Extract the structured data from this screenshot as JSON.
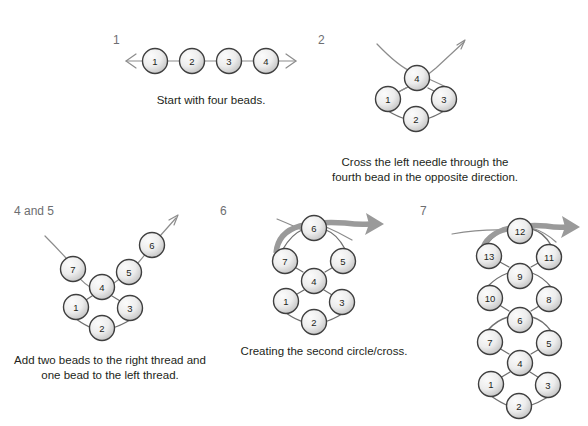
{
  "figure": {
    "background_color": "#ffffff",
    "bead_fill_light": "#f2f2f2",
    "bead_fill_dark": "#c9c9c9",
    "bead_stroke": "#3f3f3f",
    "thread_color": "#8c8c8c",
    "arrow_color": "#9a9a9a",
    "label_color": "#6d6e71",
    "text_color": "#231f20"
  },
  "panels": [
    {
      "id": "panel-1",
      "step_label": "1",
      "caption": "Start with four beads.",
      "beads": [
        {
          "number": "1",
          "x": 155,
          "y": 61
        },
        {
          "number": "2",
          "x": 192,
          "y": 61
        },
        {
          "number": "3",
          "x": 229,
          "y": 61
        },
        {
          "number": "4",
          "x": 266,
          "y": 61
        }
      ]
    },
    {
      "id": "panel-2",
      "step_label": "2",
      "caption_line_1": "Cross the left needle through the",
      "caption_line_2": "fourth bead in the opposite direction.",
      "beads": [
        {
          "number": "4",
          "x": 417,
          "y": 78
        },
        {
          "number": "1",
          "x": 388,
          "y": 99
        },
        {
          "number": "3",
          "x": 444,
          "y": 99
        },
        {
          "number": "2",
          "x": 416,
          "y": 119
        }
      ]
    },
    {
      "id": "panel-4and5",
      "step_label": "4 and 5",
      "caption_line_1": "Add two beads to the right thread and",
      "caption_line_2": "one bead to the left thread.",
      "beads": [
        {
          "number": "6",
          "x": 152,
          "y": 245
        },
        {
          "number": "5",
          "x": 129,
          "y": 272
        },
        {
          "number": "7",
          "x": 73,
          "y": 269
        },
        {
          "number": "4",
          "x": 102,
          "y": 287
        },
        {
          "number": "1",
          "x": 76,
          "y": 307
        },
        {
          "number": "3",
          "x": 130,
          "y": 308
        },
        {
          "number": "2",
          "x": 102,
          "y": 328
        }
      ]
    },
    {
      "id": "panel-6",
      "step_label": "6",
      "caption": "Creating the second circle/cross.",
      "beads": [
        {
          "number": "6",
          "x": 314,
          "y": 228
        },
        {
          "number": "7",
          "x": 285,
          "y": 261
        },
        {
          "number": "5",
          "x": 343,
          "y": 261
        },
        {
          "number": "4",
          "x": 314,
          "y": 281
        },
        {
          "number": "1",
          "x": 286,
          "y": 301
        },
        {
          "number": "3",
          "x": 342,
          "y": 302
        },
        {
          "number": "2",
          "x": 314,
          "y": 322
        }
      ]
    },
    {
      "id": "panel-7",
      "step_label": "7",
      "caption": "",
      "beads": [
        {
          "number": "12",
          "x": 520,
          "y": 231
        },
        {
          "number": "13",
          "x": 489,
          "y": 256
        },
        {
          "number": "11",
          "x": 549,
          "y": 257
        },
        {
          "number": "9",
          "x": 520,
          "y": 276
        },
        {
          "number": "10",
          "x": 490,
          "y": 298
        },
        {
          "number": "8",
          "x": 549,
          "y": 299
        },
        {
          "number": "6",
          "x": 520,
          "y": 320
        },
        {
          "number": "7",
          "x": 490,
          "y": 342
        },
        {
          "number": "5",
          "x": 549,
          "y": 343
        },
        {
          "number": "4",
          "x": 520,
          "y": 363
        },
        {
          "number": "1",
          "x": 491,
          "y": 384
        },
        {
          "number": "3",
          "x": 548,
          "y": 385
        },
        {
          "number": "2",
          "x": 519,
          "y": 406
        }
      ]
    }
  ]
}
